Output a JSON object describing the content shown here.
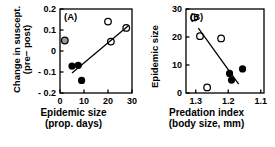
{
  "figure": {
    "background": "#ffffff",
    "foreground": "#000000",
    "open_marker_edge": "#000000",
    "filled_marker_fill": "#000000",
    "outlier_marker_fill": "#9a9a9a",
    "line_color": "#000000"
  },
  "chart_data": [
    {
      "type": "scatter",
      "panel_label": "(A)",
      "title": "",
      "xlabel": "Epidemic size",
      "xlabel_line2": "(prop. days)",
      "ylabel": "Change in suscept.",
      "ylabel_line2": "(pre− post)",
      "xlim": [
        0,
        30
      ],
      "ylim": [
        -0.2,
        0.2
      ],
      "xticks": [
        0,
        10,
        20,
        30
      ],
      "xticklabels": [
        "0",
        "10",
        "20",
        "30"
      ],
      "yticks": [
        -0.2,
        -0.1,
        0,
        0.1,
        0.2
      ],
      "yticklabels": [
        "- 0.2",
        "- 0.1",
        "0",
        "0.1",
        "0.2"
      ],
      "x_reversed": false,
      "grid": false,
      "legend": "none",
      "series": [
        {
          "name": "open circles",
          "marker": "open-circle",
          "points": [
            {
              "x": 20.0,
              "y": 0.14
            },
            {
              "x": 21.2,
              "y": 0.045
            },
            {
              "x": 27.6,
              "y": 0.11
            }
          ]
        },
        {
          "name": "filled circles",
          "marker": "filled-circle",
          "points": [
            {
              "x": 5.0,
              "y": -0.072
            },
            {
              "x": 7.6,
              "y": -0.068
            },
            {
              "x": 9.0,
              "y": -0.14
            }
          ]
        },
        {
          "name": "grey outlier circle",
          "marker": "grey-circle",
          "points": [
            {
              "x": 2.0,
              "y": 0.05
            }
          ]
        }
      ],
      "trendline": {
        "x1": 5.0,
        "y1": -0.105,
        "x2": 28.6,
        "y2": 0.122
      }
    },
    {
      "type": "scatter",
      "panel_label": "(B)",
      "title": "",
      "xlabel": "Predation index",
      "xlabel_line2": "(body size, mm)",
      "ylabel": "Epidemic size",
      "ylabel_line2": "",
      "xlim": [
        1.33,
        1.09
      ],
      "ylim": [
        0,
        30
      ],
      "xticks": [
        1.3,
        1.2,
        1.1
      ],
      "xticklabels": [
        "1.3",
        "1.2",
        "1.1"
      ],
      "yticks": [
        0,
        10,
        20,
        30
      ],
      "yticklabels": [
        "0",
        "10",
        "20",
        "30"
      ],
      "x_reversed": true,
      "grid": false,
      "legend": "none",
      "series": [
        {
          "name": "open circles",
          "marker": "open-circle",
          "points": [
            {
              "x": 1.305,
              "y": 27.0
            },
            {
              "x": 1.287,
              "y": 20.3
            },
            {
              "x": 1.222,
              "y": 19.5
            },
            {
              "x": 1.265,
              "y": 2.0
            }
          ]
        },
        {
          "name": "filled circles",
          "marker": "filled-circle",
          "points": [
            {
              "x": 1.196,
              "y": 7.0
            },
            {
              "x": 1.19,
              "y": 4.6
            },
            {
              "x": 1.156,
              "y": 8.6
            }
          ]
        }
      ],
      "trendline": {
        "x1": 1.292,
        "y1": 23.2,
        "x2": 1.168,
        "y2": 3.2
      }
    }
  ]
}
